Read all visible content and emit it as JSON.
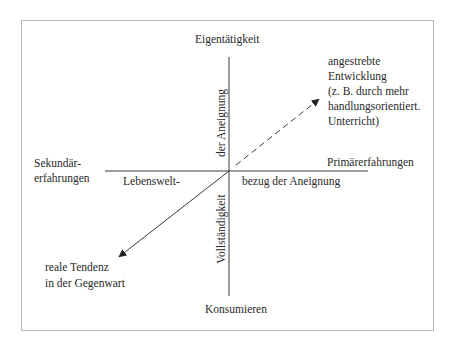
{
  "diagram": {
    "axes": {
      "top": "Eigentätigkeit",
      "bottom": "Konsumieren",
      "left_line1": "Sekundär-",
      "left_line2": "erfahrungen",
      "right": "Primärerfahrungen"
    },
    "axis_captions": {
      "vertical_upper": "der Aneignung",
      "vertical_lower": "Vollständigkeit",
      "horizontal_left": "Lebenswelt-",
      "horizontal_right": "bezug der Aneignung"
    },
    "arrows": {
      "desired": {
        "style": "dashed",
        "lines": [
          "angestrebte",
          "Entwicklung",
          "(z. B. durch mehr",
          "handlungsorientiert.",
          "Unterricht)"
        ]
      },
      "actual": {
        "style": "solid",
        "lines": [
          "reale Tendenz",
          "in der Gegenwart"
        ]
      }
    },
    "colors": {
      "line": "#3a3a3a",
      "frame": "#b8b8b8",
      "text": "#2a2a2a"
    }
  }
}
